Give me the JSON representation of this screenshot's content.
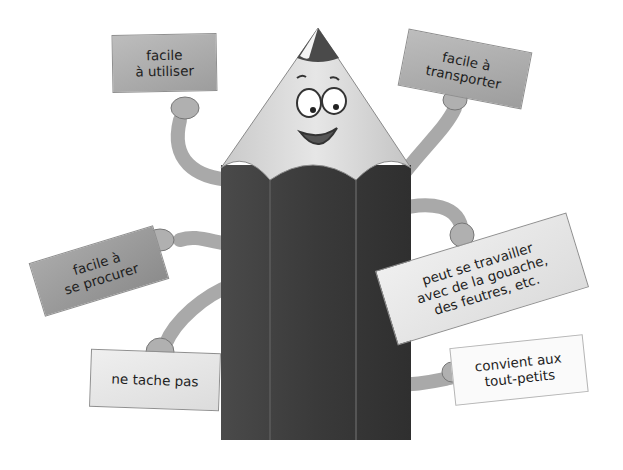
{
  "illustration": {
    "subject": "pencil-character",
    "colors": {
      "pencil_body": "#3d3d3d",
      "pencil_wood": "#d8d8d8",
      "pencil_tip": "#4a4a4a",
      "arm": "#b4b4b4",
      "background": "#ffffff"
    }
  },
  "signs": [
    {
      "id": "top-left",
      "lines": [
        "facile",
        "à utiliser"
      ]
    },
    {
      "id": "top-right",
      "lines": [
        "facile à",
        "transporter"
      ]
    },
    {
      "id": "middle-left",
      "lines": [
        "facile à",
        "se procurer"
      ]
    },
    {
      "id": "middle-right",
      "lines": [
        "peut se travailler",
        "avec de la gouache,",
        "des feutres, etc."
      ]
    },
    {
      "id": "bottom-left",
      "lines": [
        "ne tache pas"
      ]
    },
    {
      "id": "bottom-right",
      "lines": [
        "convient aux",
        "tout-petits"
      ]
    }
  ]
}
